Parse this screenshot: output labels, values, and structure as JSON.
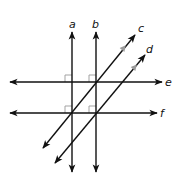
{
  "diagram": {
    "type": "geometry-parallel-perpendicular-lines",
    "colors": {
      "line": "#111111",
      "right_angle_mark": "#999999",
      "parallel_mark": "#9a9a9a",
      "background": "#ffffff"
    },
    "lines": [
      {
        "id": "a",
        "label": "a",
        "orientation": "vertical",
        "x": 72,
        "y1": 32,
        "y2": 172
      },
      {
        "id": "b",
        "label": "b",
        "orientation": "vertical",
        "x": 96,
        "y1": 32,
        "y2": 172
      },
      {
        "id": "c",
        "label": "c",
        "orientation": "diagonal",
        "x1": 43,
        "y1": 148,
        "x2": 135,
        "y2": 35
      },
      {
        "id": "d",
        "label": "d",
        "orientation": "diagonal",
        "x1": 55,
        "y1": 163,
        "x2": 145,
        "y2": 55
      },
      {
        "id": "e",
        "label": "e",
        "orientation": "horizontal",
        "y": 82,
        "x1": 10,
        "x2": 162
      },
      {
        "id": "f",
        "label": "f",
        "orientation": "horizontal",
        "y": 113,
        "x1": 10,
        "x2": 157
      }
    ],
    "labels": {
      "a": "a",
      "b": "b",
      "c": "c",
      "d": "d",
      "e": "e",
      "f": "f"
    },
    "right_angle_marks": [
      {
        "at": "a-e",
        "x": 72,
        "y": 82
      },
      {
        "at": "b-e",
        "x": 96,
        "y": 82
      },
      {
        "at": "a-f",
        "x": 72,
        "y": 113
      },
      {
        "at": "b-f",
        "x": 96,
        "y": 113
      }
    ],
    "parallel_marks": [
      {
        "on": "c",
        "x": 122,
        "y": 50
      },
      {
        "on": "d",
        "x": 133,
        "y": 69
      }
    ]
  }
}
